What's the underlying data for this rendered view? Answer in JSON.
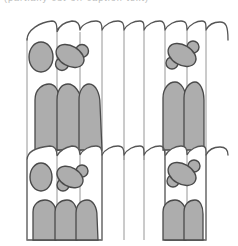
{
  "caption": {
    "text": "(partially cut-off caption text)"
  },
  "diagram": {
    "title": "",
    "fill_color": "#adadad",
    "stroke_color": "#4a4a4a",
    "rows": [
      {
        "name": "top-row",
        "wall_x": [
          27,
          57,
          80,
          102,
          124,
          144,
          165,
          187,
          206
        ],
        "left_group": {
          "oval": [
            40,
            57
          ],
          "cross": [
            63,
            58
          ],
          "columns": 3
        },
        "right_group": {
          "cross": [
            182,
            56
          ],
          "columns": 2
        }
      },
      {
        "name": "bottom-row",
        "wall_x": [
          27,
          57,
          80,
          102,
          124,
          144,
          165,
          187,
          206
        ],
        "left_group": {
          "oval": [
            40,
            177
          ],
          "cross": [
            63,
            178
          ],
          "columns": 3
        },
        "right_group": {
          "cross": [
            182,
            175
          ],
          "columns": 2
        }
      }
    ]
  }
}
